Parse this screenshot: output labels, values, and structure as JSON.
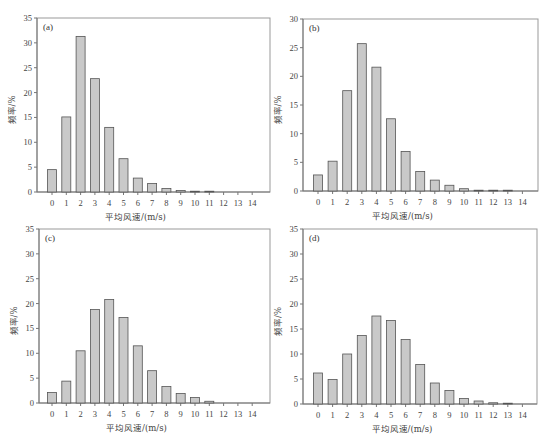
{
  "chart_data": [
    {
      "type": "bar",
      "panel_label": "(a)",
      "xlabel": "平均风速/(m/s)",
      "ylabel": "频率/%",
      "categories": [
        "0",
        "1",
        "2",
        "3",
        "4",
        "5",
        "6",
        "7",
        "8",
        "9",
        "10",
        "11",
        "12",
        "13",
        "14"
      ],
      "values": [
        4.5,
        15.1,
        31.3,
        22.8,
        13.0,
        6.7,
        2.8,
        1.7,
        0.7,
        0.3,
        0.15,
        0.05,
        0,
        0,
        0
      ],
      "ylim": [
        0,
        35
      ],
      "yticks": [
        0,
        5,
        10,
        15,
        20,
        25,
        30,
        35
      ],
      "grid": false
    },
    {
      "type": "bar",
      "panel_label": "(b)",
      "xlabel": "平均风速/(m/s)",
      "ylabel": "频率/%",
      "categories": [
        "0",
        "1",
        "2",
        "3",
        "4",
        "5",
        "6",
        "7",
        "8",
        "9",
        "10",
        "11",
        "12",
        "13",
        "14"
      ],
      "values": [
        2.8,
        5.2,
        17.5,
        25.7,
        21.6,
        12.6,
        6.9,
        3.4,
        1.9,
        1.0,
        0.4,
        0.05,
        0.05,
        0.05,
        0
      ],
      "ylim": [
        0,
        30
      ],
      "yticks": [
        0,
        5,
        10,
        15,
        20,
        25,
        30
      ],
      "grid": false
    },
    {
      "type": "bar",
      "panel_label": "(c)",
      "xlabel": "平均风速/(m/s)",
      "ylabel": "频率/%",
      "categories": [
        "0",
        "1",
        "2",
        "3",
        "4",
        "5",
        "6",
        "7",
        "8",
        "9",
        "10",
        "11",
        "12",
        "13",
        "14"
      ],
      "values": [
        2.1,
        4.4,
        10.5,
        18.8,
        20.8,
        17.2,
        11.5,
        6.5,
        3.3,
        1.9,
        1.1,
        0.35,
        0,
        0,
        0
      ],
      "ylim": [
        0,
        35
      ],
      "yticks": [
        0,
        5,
        10,
        15,
        20,
        25,
        30,
        35
      ],
      "grid": false
    },
    {
      "type": "bar",
      "panel_label": "(d)",
      "xlabel": "平均风速/(m/s)",
      "ylabel": "频率/%",
      "categories": [
        "0",
        "1",
        "2",
        "3",
        "4",
        "5",
        "6",
        "7",
        "8",
        "9",
        "10",
        "11",
        "12",
        "13",
        "14"
      ],
      "values": [
        6.2,
        4.9,
        10.0,
        13.7,
        17.6,
        16.7,
        12.9,
        7.9,
        4.2,
        2.7,
        1.1,
        0.6,
        0.25,
        0.1,
        0
      ],
      "ylim": [
        0,
        35
      ],
      "yticks": [
        0,
        5,
        10,
        15,
        20,
        25,
        30,
        35
      ],
      "grid": false
    }
  ],
  "colors": {
    "bar_fill": "#c9c9c9",
    "bar_stroke": "#555555",
    "axis": "#777777",
    "frame": "#999999"
  }
}
